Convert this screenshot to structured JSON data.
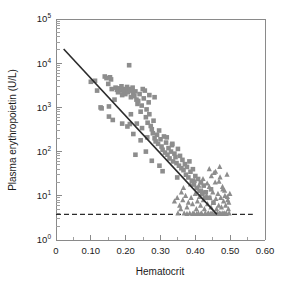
{
  "chart_data": {
    "type": "scatter",
    "title": "",
    "xlabel": "Hematocrit",
    "ylabel": "Plasma erythropoietin (U/L)",
    "xlim": [
      0,
      0.6
    ],
    "ylim": [
      1,
      100000
    ],
    "yscale": "log",
    "xscale": "linear",
    "grid": false,
    "legend_position": "none",
    "xticks": [
      0,
      0.1,
      0.2,
      0.3,
      0.4,
      0.5,
      0.6
    ],
    "xticklabels": [
      "0",
      "0.10",
      "0.20",
      "0.30",
      "0.40",
      "0.50",
      "0.60"
    ],
    "yticks": [
      1,
      10,
      100,
      1000,
      10000,
      100000
    ],
    "yticklabels": [
      "10^0",
      "10^1",
      "10^2",
      "10^3",
      "10^4",
      "10^5"
    ],
    "ytick_mantissa": "10",
    "ytick_exponents": [
      "0",
      "1",
      "2",
      "3",
      "4",
      "5"
    ],
    "marker_color": "#8d8d8d",
    "line_color": "#2b2b2b",
    "axis_color": "#8a8a8a",
    "annotations": [
      {
        "name": "detection-limit-line",
        "type": "hline",
        "y": 3.8,
        "style": "dashed",
        "x_start": 0.0,
        "x_end": 0.565
      },
      {
        "name": "regression-line",
        "type": "line",
        "x_start": 0.022,
        "y_start": 21000,
        "x_end": 0.462,
        "y_end": 3.8
      }
    ],
    "series": [
      {
        "name": "anemic patients",
        "marker": "square",
        "color": "#8d8d8d",
        "points": [
          [
            0.1,
            3800
          ],
          [
            0.112,
            4000
          ],
          [
            0.118,
            2400
          ],
          [
            0.128,
            1000
          ],
          [
            0.131,
            950
          ],
          [
            0.14,
            5000
          ],
          [
            0.145,
            4600
          ],
          [
            0.15,
            3400
          ],
          [
            0.152,
            620
          ],
          [
            0.155,
            4800
          ],
          [
            0.158,
            4300
          ],
          [
            0.16,
            2600
          ],
          [
            0.163,
            520
          ],
          [
            0.168,
            1500
          ],
          [
            0.171,
            2800
          ],
          [
            0.175,
            2500
          ],
          [
            0.178,
            2200
          ],
          [
            0.181,
            2700
          ],
          [
            0.185,
            2400
          ],
          [
            0.188,
            3000
          ],
          [
            0.19,
            1900
          ],
          [
            0.193,
            2600
          ],
          [
            0.196,
            2300
          ],
          [
            0.199,
            2000
          ],
          [
            0.201,
            2500
          ],
          [
            0.204,
            2900
          ],
          [
            0.207,
            2200
          ],
          [
            0.21,
            9000
          ],
          [
            0.212,
            2600
          ],
          [
            0.215,
            1700
          ],
          [
            0.218,
            2400
          ],
          [
            0.22,
            2800
          ],
          [
            0.222,
            2100
          ],
          [
            0.225,
            1800
          ],
          [
            0.228,
            2300
          ],
          [
            0.231,
            1500
          ],
          [
            0.234,
            1200
          ],
          [
            0.236,
            1400
          ],
          [
            0.24,
            2000
          ],
          [
            0.243,
            800
          ],
          [
            0.246,
            1100
          ],
          [
            0.249,
            2600
          ],
          [
            0.252,
            1600
          ],
          [
            0.255,
            2400
          ],
          [
            0.258,
            600
          ],
          [
            0.26,
            900
          ],
          [
            0.263,
            450
          ],
          [
            0.266,
            1300
          ],
          [
            0.268,
            700
          ],
          [
            0.272,
            380
          ],
          [
            0.275,
            320
          ],
          [
            0.278,
            260
          ],
          [
            0.28,
            500
          ],
          [
            0.283,
            200
          ],
          [
            0.286,
            170
          ],
          [
            0.29,
            240
          ],
          [
            0.293,
            150
          ],
          [
            0.296,
            300
          ],
          [
            0.3,
            190
          ],
          [
            0.303,
            130
          ],
          [
            0.306,
            110
          ],
          [
            0.31,
            220
          ],
          [
            0.313,
            95
          ],
          [
            0.316,
            160
          ],
          [
            0.32,
            85
          ],
          [
            0.323,
            120
          ],
          [
            0.326,
            70
          ],
          [
            0.33,
            100
          ],
          [
            0.333,
            140
          ],
          [
            0.336,
            60
          ],
          [
            0.34,
            90
          ],
          [
            0.343,
            75
          ],
          [
            0.346,
            55
          ],
          [
            0.35,
            115
          ],
          [
            0.353,
            48
          ],
          [
            0.356,
            80
          ],
          [
            0.36,
            42
          ],
          [
            0.363,
            65
          ],
          [
            0.366,
            38
          ],
          [
            0.37,
            52
          ],
          [
            0.373,
            30
          ],
          [
            0.376,
            45
          ],
          [
            0.38,
            26
          ],
          [
            0.383,
            60
          ],
          [
            0.386,
            35
          ],
          [
            0.39,
            22
          ],
          [
            0.393,
            40
          ],
          [
            0.396,
            18
          ],
          [
            0.4,
            28
          ],
          [
            0.404,
            15
          ],
          [
            0.408,
            24
          ],
          [
            0.412,
            13
          ],
          [
            0.416,
            20
          ],
          [
            0.42,
            11
          ],
          [
            0.424,
            17
          ],
          [
            0.428,
            9
          ],
          [
            0.19,
            430
          ],
          [
            0.205,
            370
          ],
          [
            0.232,
            430
          ],
          [
            0.247,
            340
          ],
          [
            0.268,
            1900
          ],
          [
            0.283,
            1700
          ],
          [
            0.152,
            1050
          ],
          [
            0.215,
            700
          ],
          [
            0.228,
            85
          ],
          [
            0.258,
            100
          ],
          [
            0.275,
            62
          ],
          [
            0.297,
            48
          ],
          [
            0.306,
            36
          ],
          [
            0.318,
            210
          ],
          [
            0.334,
            150
          ],
          [
            0.348,
            26
          ],
          [
            0.222,
            250
          ],
          [
            0.243,
            180
          ],
          [
            0.262,
            210
          ],
          [
            0.212,
            420
          ],
          [
            0.44,
            9
          ],
          [
            0.452,
            7
          ],
          [
            0.43,
            12
          ],
          [
            0.445,
            14
          ]
        ]
      },
      {
        "name": "normal subjects",
        "marker": "triangle",
        "color": "#8d8d8d",
        "points": [
          [
            0.34,
            7.5
          ],
          [
            0.348,
            9
          ],
          [
            0.355,
            6
          ],
          [
            0.36,
            12
          ],
          [
            0.364,
            8
          ],
          [
            0.368,
            4.0
          ],
          [
            0.372,
            10
          ],
          [
            0.376,
            5.5
          ],
          [
            0.38,
            7
          ],
          [
            0.384,
            4.0
          ],
          [
            0.388,
            9
          ],
          [
            0.392,
            6.5
          ],
          [
            0.396,
            4.0
          ],
          [
            0.4,
            11
          ],
          [
            0.403,
            5
          ],
          [
            0.406,
            7.5
          ],
          [
            0.409,
            4.0
          ],
          [
            0.412,
            9.5
          ],
          [
            0.415,
            6
          ],
          [
            0.418,
            4.0
          ],
          [
            0.42,
            13
          ],
          [
            0.423,
            8
          ],
          [
            0.426,
            5
          ],
          [
            0.429,
            4.0
          ],
          [
            0.432,
            10
          ],
          [
            0.435,
            6.5
          ],
          [
            0.438,
            4.0
          ],
          [
            0.44,
            16
          ],
          [
            0.442,
            9
          ],
          [
            0.445,
            5.5
          ],
          [
            0.448,
            4.0
          ],
          [
            0.45,
            12
          ],
          [
            0.452,
            7
          ],
          [
            0.455,
            4.0
          ],
          [
            0.457,
            20
          ],
          [
            0.459,
            8.5
          ],
          [
            0.461,
            5
          ],
          [
            0.463,
            4.0
          ],
          [
            0.465,
            11
          ],
          [
            0.467,
            6
          ],
          [
            0.469,
            4.0
          ],
          [
            0.471,
            26
          ],
          [
            0.473,
            9
          ],
          [
            0.475,
            5.5
          ],
          [
            0.477,
            4.0
          ],
          [
            0.479,
            14
          ],
          [
            0.481,
            7.5
          ],
          [
            0.483,
            4.0
          ],
          [
            0.485,
            10
          ],
          [
            0.487,
            6
          ],
          [
            0.489,
            4.0
          ],
          [
            0.491,
            30
          ],
          [
            0.493,
            8
          ],
          [
            0.495,
            5
          ],
          [
            0.497,
            4.0
          ],
          [
            0.499,
            11
          ],
          [
            0.376,
            3.9
          ],
          [
            0.392,
            3.9
          ],
          [
            0.404,
            3.9
          ],
          [
            0.416,
            3.9
          ],
          [
            0.428,
            3.9
          ],
          [
            0.436,
            3.9
          ],
          [
            0.444,
            3.9
          ],
          [
            0.456,
            3.9
          ],
          [
            0.464,
            3.9
          ],
          [
            0.472,
            3.9
          ],
          [
            0.48,
            3.9
          ],
          [
            0.488,
            3.9
          ],
          [
            0.35,
            4.0
          ],
          [
            0.358,
            5
          ],
          [
            0.366,
            15
          ],
          [
            0.386,
            18
          ],
          [
            0.398,
            22
          ],
          [
            0.41,
            17
          ],
          [
            0.422,
            24
          ],
          [
            0.434,
            19
          ],
          [
            0.446,
            28
          ],
          [
            0.458,
            35
          ],
          [
            0.468,
            21
          ],
          [
            0.478,
            16
          ],
          [
            0.484,
            13
          ],
          [
            0.492,
            9.5
          ],
          [
            0.496,
            7
          ],
          [
            0.47,
            45
          ],
          [
            0.44,
            40
          ],
          [
            0.454,
            33
          ]
        ]
      }
    ]
  },
  "figure": {
    "background": "#ffffff",
    "plot_area": {
      "left": 56,
      "top": 19,
      "right": 265,
      "bottom": 240
    }
  }
}
